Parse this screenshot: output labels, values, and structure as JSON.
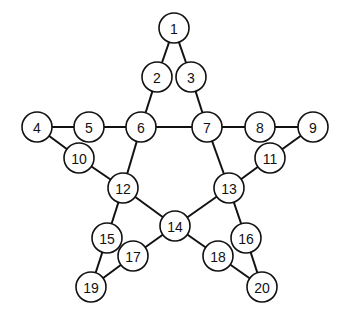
{
  "diagram": {
    "type": "graph",
    "node_radius": 15,
    "nodes": [
      {
        "id": "1",
        "label": "1",
        "x": 174,
        "y": 28
      },
      {
        "id": "2",
        "label": "2",
        "x": 157,
        "y": 77
      },
      {
        "id": "3",
        "label": "3",
        "x": 191,
        "y": 77
      },
      {
        "id": "4",
        "label": "4",
        "x": 37,
        "y": 127
      },
      {
        "id": "5",
        "label": "5",
        "x": 89,
        "y": 127
      },
      {
        "id": "6",
        "label": "6",
        "x": 141,
        "y": 127
      },
      {
        "id": "7",
        "label": "7",
        "x": 207,
        "y": 127
      },
      {
        "id": "8",
        "label": "8",
        "x": 260,
        "y": 127
      },
      {
        "id": "9",
        "label": "9",
        "x": 313,
        "y": 127
      },
      {
        "id": "10",
        "label": "10",
        "x": 79,
        "y": 158
      },
      {
        "id": "11",
        "label": "11",
        "x": 270,
        "y": 158
      },
      {
        "id": "12",
        "label": "12",
        "x": 123,
        "y": 188
      },
      {
        "id": "13",
        "label": "13",
        "x": 229,
        "y": 188
      },
      {
        "id": "14",
        "label": "14",
        "x": 175,
        "y": 226
      },
      {
        "id": "15",
        "label": "15",
        "x": 107,
        "y": 238
      },
      {
        "id": "16",
        "label": "16",
        "x": 246,
        "y": 238
      },
      {
        "id": "17",
        "label": "17",
        "x": 133,
        "y": 256
      },
      {
        "id": "18",
        "label": "18",
        "x": 218,
        "y": 256
      },
      {
        "id": "19",
        "label": "19",
        "x": 91,
        "y": 287
      },
      {
        "id": "20",
        "label": "20",
        "x": 262,
        "y": 287
      }
    ],
    "edges": [
      [
        "1",
        "2"
      ],
      [
        "1",
        "3"
      ],
      [
        "2",
        "6"
      ],
      [
        "3",
        "7"
      ],
      [
        "4",
        "5"
      ],
      [
        "5",
        "6"
      ],
      [
        "6",
        "7"
      ],
      [
        "7",
        "8"
      ],
      [
        "8",
        "9"
      ],
      [
        "4",
        "10"
      ],
      [
        "10",
        "12"
      ],
      [
        "9",
        "11"
      ],
      [
        "11",
        "13"
      ],
      [
        "6",
        "12"
      ],
      [
        "7",
        "13"
      ],
      [
        "12",
        "14"
      ],
      [
        "13",
        "14"
      ],
      [
        "12",
        "15"
      ],
      [
        "13",
        "16"
      ],
      [
        "14",
        "17"
      ],
      [
        "14",
        "18"
      ],
      [
        "15",
        "19"
      ],
      [
        "16",
        "20"
      ],
      [
        "17",
        "19"
      ],
      [
        "18",
        "20"
      ]
    ]
  }
}
